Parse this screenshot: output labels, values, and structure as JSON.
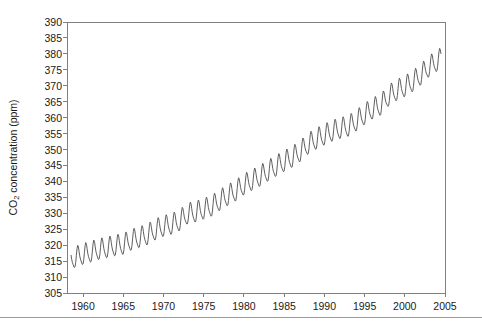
{
  "chart_data": {
    "type": "line",
    "title": "",
    "subtitle": "",
    "xlabel": "",
    "ylabel": "CO2 concentration (ppm)",
    "ylabel_parts": {
      "pre": "CO",
      "sub": "2",
      "post": " concentration (ppm)"
    },
    "xlim": [
      1958,
      2005
    ],
    "ylim": [
      305,
      390
    ],
    "x_ticks": [
      1960,
      1965,
      1970,
      1975,
      1980,
      1985,
      1990,
      1995,
      2000,
      2005
    ],
    "x_tick_labels": [
      "1960",
      "1965",
      "1970",
      "1975",
      "1980",
      "1985",
      "1990",
      "1995",
      "2000",
      "2005"
    ],
    "y_ticks": [
      305,
      310,
      315,
      320,
      325,
      330,
      335,
      340,
      345,
      350,
      355,
      360,
      365,
      370,
      375,
      380,
      385,
      390
    ],
    "y_tick_labels": [
      "305",
      "310",
      "315",
      "320",
      "325",
      "330",
      "335",
      "340",
      "345",
      "350",
      "355",
      "360",
      "365",
      "370",
      "375",
      "380",
      "385",
      "390"
    ],
    "grid": false,
    "legend": "none",
    "line_color": "#4d4d4d",
    "line_width": 0.9,
    "axis_color": "#808080",
    "background": "#ffffff",
    "series": [
      {
        "name": "Monthly mean CO2 (Mauna Loa)",
        "seasonal_amplitude_ppm": 3.1,
        "seasonal_peak_month": 5,
        "x": [
          1958.5,
          1959.0,
          1960.0,
          1961.0,
          1962.0,
          1963.0,
          1964.0,
          1965.0,
          1966.0,
          1967.0,
          1968.0,
          1969.0,
          1970.0,
          1971.0,
          1972.0,
          1973.0,
          1974.0,
          1975.0,
          1976.0,
          1977.0,
          1978.0,
          1979.0,
          1980.0,
          1981.0,
          1982.0,
          1983.0,
          1984.0,
          1985.0,
          1986.0,
          1987.0,
          1988.0,
          1989.0,
          1990.0,
          1991.0,
          1992.0,
          1993.0,
          1994.0,
          1995.0,
          1996.0,
          1997.0,
          1998.0,
          1999.0,
          2000.0,
          2001.0,
          2002.0,
          2003.0,
          2004.0
        ],
        "annual_mean": [
          315.3,
          315.98,
          316.91,
          317.64,
          318.45,
          318.99,
          319.62,
          320.04,
          321.38,
          322.16,
          323.04,
          324.62,
          325.68,
          326.32,
          327.45,
          329.68,
          330.18,
          331.11,
          332.04,
          333.83,
          335.4,
          336.84,
          338.75,
          340.11,
          341.45,
          343.05,
          344.58,
          346.04,
          347.39,
          349.16,
          351.56,
          353.07,
          354.35,
          355.57,
          356.38,
          357.07,
          358.82,
          360.8,
          362.59,
          363.71,
          366.65,
          368.33,
          369.52,
          371.13,
          373.22,
          375.77,
          377.49
        ]
      }
    ]
  },
  "figure": {
    "plot_left_px": 67,
    "plot_right_px": 445,
    "plot_top_px": 22,
    "plot_bottom_px": 293
  }
}
